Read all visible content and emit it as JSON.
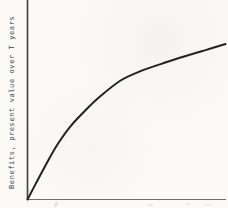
{
  "figure": {
    "background_color": "#fbfaf6",
    "y_axis_color": "#474747",
    "x_axis_color": "#6f6f6f",
    "curve_color": "#222222",
    "label_color": "#3a3a3a"
  },
  "chart_data": {
    "type": "line",
    "title": "",
    "xlabel": "",
    "ylabel": "Benefits, present value over T years",
    "grid": false,
    "legend": "none",
    "x_axis": {
      "tick_labels": [],
      "range_normalized": [
        0,
        1
      ]
    },
    "y_axis": {
      "tick_labels": [],
      "range_normalized": [
        0,
        1
      ]
    },
    "series": [
      {
        "name": "present-value-of-benefits-curve",
        "shape": "concave-increasing (diminishing returns)",
        "points_normalized": [
          [
            0.0,
            0.0
          ],
          [
            0.04,
            0.097
          ],
          [
            0.091,
            0.219
          ],
          [
            0.152,
            0.355
          ],
          [
            0.217,
            0.471
          ],
          [
            0.293,
            0.574
          ],
          [
            0.369,
            0.665
          ],
          [
            0.47,
            0.765
          ],
          [
            0.571,
            0.826
          ],
          [
            0.672,
            0.871
          ],
          [
            0.773,
            0.913
          ],
          [
            0.899,
            0.961
          ],
          [
            1.0,
            1.0
          ]
        ]
      }
    ]
  }
}
